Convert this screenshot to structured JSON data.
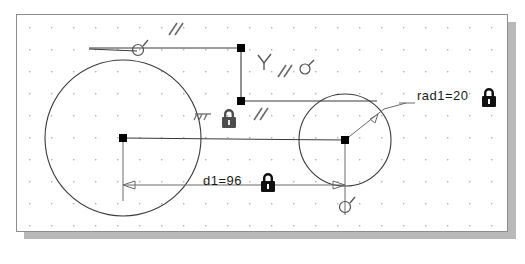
{
  "view": {
    "background_color": "#ffffff",
    "canvas_color": "#ffffff",
    "canvas_border_color": "#8c8c8c",
    "shadow_color": "#b8b8b8",
    "grid": {
      "visible": true,
      "spacing_px": 22,
      "dot_color": "#b0b0b0"
    }
  },
  "style": {
    "geometry_color": "#3a3a3a",
    "construction_color": "#555555",
    "dimension_color": "#6a6a6a",
    "point_color": "#000000",
    "glyph_color": "#4d4d4d",
    "text_color": "#1a1a1a"
  },
  "dimensions": [
    {
      "id": "d1",
      "label": "d1=96",
      "value": 96,
      "name": "d1",
      "locked": true,
      "type": "linear-distance"
    },
    {
      "id": "rad1",
      "label": "rad1=20",
      "value": 20,
      "name": "rad1",
      "locked": true,
      "type": "radius"
    }
  ],
  "lock_badges": [
    {
      "for": "d1",
      "symbol": "lock-icon"
    },
    {
      "for": "rad1",
      "symbol": "lock-icon"
    },
    {
      "for": "fix",
      "symbol": "lock-icon"
    }
  ],
  "constraint_glyphs": [
    {
      "name": "parallel-top",
      "symbol": "//",
      "meaning": "parallel"
    },
    {
      "name": "parallel-mid",
      "symbol": "//",
      "meaning": "parallel"
    },
    {
      "name": "parallel-lower",
      "symbol": "//",
      "meaning": "parallel"
    },
    {
      "name": "perpendicular",
      "symbol": "Y",
      "meaning": "perpendicular"
    },
    {
      "name": "coincident-top",
      "symbol": "o",
      "meaning": "coincident"
    },
    {
      "name": "coincident-right",
      "symbol": "o",
      "meaning": "coincident"
    },
    {
      "name": "coincident-bottom",
      "symbol": "o",
      "meaning": "coincident"
    },
    {
      "name": "ground-fix",
      "symbol": "///",
      "meaning": "fixed / ground"
    }
  ],
  "geometry": {
    "circles": [
      {
        "name": "left-circle",
        "cx": 106,
        "cy": 123,
        "r": 78
      },
      {
        "name": "right-circle",
        "cx": 328,
        "cy": 125,
        "r": 46
      }
    ],
    "points": [
      {
        "name": "left-center-point",
        "x": 106,
        "y": 123
      },
      {
        "name": "right-center-point",
        "x": 328,
        "y": 125
      },
      {
        "name": "upper-vertex-point",
        "x": 224,
        "y": 33
      },
      {
        "name": "mid-vertex-point",
        "x": 224,
        "y": 86
      }
    ]
  }
}
